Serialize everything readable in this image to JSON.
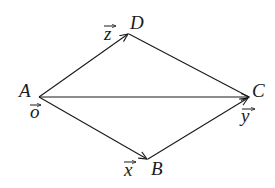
{
  "diagram": {
    "points": {
      "A": {
        "label": "A",
        "vector": "o"
      },
      "B": {
        "label": "B",
        "vector": "x"
      },
      "C": {
        "label": "C",
        "vector": "y"
      },
      "D": {
        "label": "D",
        "vector": "z"
      }
    },
    "edges": [
      {
        "from": "A",
        "to": "D",
        "arrow": true
      },
      {
        "from": "A",
        "to": "B",
        "arrow": true
      },
      {
        "from": "A",
        "to": "C",
        "arrow": true
      },
      {
        "from": "B",
        "to": "C",
        "arrow": true
      },
      {
        "from": "D",
        "to": "C",
        "arrow": false
      }
    ],
    "color": "#1a1a1a"
  }
}
